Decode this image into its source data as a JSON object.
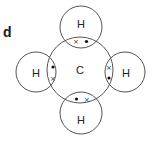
{
  "diagram": {
    "part_label": "d",
    "central_atom": {
      "symbol": "C",
      "cx": 80,
      "cy": 70,
      "r": 33
    },
    "outer_atoms": [
      {
        "position": "top",
        "symbol": "H",
        "cx": 81,
        "cy": 27,
        "r": 21
      },
      {
        "position": "left",
        "symbol": "H",
        "cx": 36,
        "cy": 72,
        "r": 20
      },
      {
        "position": "right",
        "symbol": "H",
        "cx": 125,
        "cy": 72,
        "r": 20
      },
      {
        "position": "bottom",
        "symbol": "H",
        "cx": 81,
        "cy": 113,
        "r": 21
      }
    ],
    "bonding_pairs": [
      {
        "position": "top",
        "electrons": [
          "cross",
          "dot"
        ]
      },
      {
        "position": "left",
        "electrons": [
          "dot",
          "cross"
        ]
      },
      {
        "position": "right",
        "electrons": [
          "cross",
          "dot"
        ]
      },
      {
        "position": "bottom",
        "electrons": [
          "dot",
          "cross"
        ]
      }
    ],
    "symbols": {
      "dot": "•",
      "cross": "×"
    },
    "colors": {
      "stroke": "#555555",
      "text": "#222222"
    }
  }
}
